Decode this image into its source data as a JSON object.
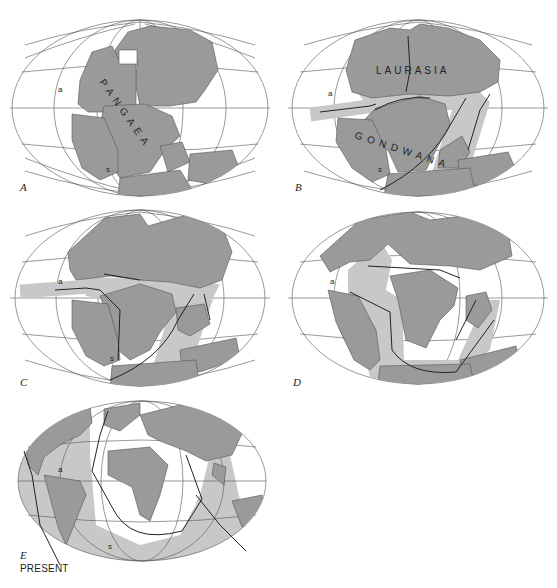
{
  "figure": {
    "colors": {
      "background": "#ffffff",
      "continent": "#9a9a9a",
      "spreading_zone": "#c8c8c8",
      "graticule": "#555555",
      "ridge_line": "#222222",
      "motion_arrow": "#ffffff"
    }
  },
  "panels": [
    {
      "id": "A",
      "label": "A",
      "supercontinent_label": "P A N G A E A",
      "point_labels": [
        "a",
        "s"
      ]
    },
    {
      "id": "B",
      "label": "B",
      "supercontinent_labels": [
        "LAURASIA",
        "G O N D W A N A"
      ],
      "point_labels": [
        "a",
        "s"
      ]
    },
    {
      "id": "C",
      "label": "C",
      "point_labels": [
        "a",
        "s"
      ]
    },
    {
      "id": "D",
      "label": "D",
      "point_labels": [
        "a"
      ]
    },
    {
      "id": "E",
      "label": "E",
      "caption": "PRESENT",
      "point_labels": [
        "a",
        "s"
      ]
    }
  ]
}
